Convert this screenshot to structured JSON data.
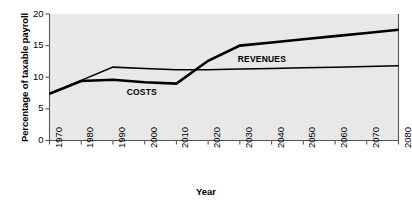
{
  "chart_data": {
    "type": "line",
    "title": "",
    "xlabel": "Year",
    "ylabel": "Percentage of taxable payroll",
    "xlim": [
      1970,
      2080
    ],
    "ylim": [
      0,
      20
    ],
    "grid": false,
    "legend_position": "inline-annotation",
    "x_ticks": [
      "1970",
      "1980",
      "1990",
      "2000",
      "2010",
      "2020",
      "2030",
      "2040",
      "2050",
      "2060",
      "2070",
      "2080"
    ],
    "y_ticks": [
      "0",
      "5",
      "10",
      "15",
      "20"
    ],
    "x": [
      1970,
      1980,
      1990,
      2000,
      2010,
      2020,
      2030,
      2040,
      2050,
      2060,
      2070,
      2080
    ],
    "series": [
      {
        "name": "COSTS",
        "style": "thick",
        "values": [
          7.4,
          9.4,
          9.6,
          9.2,
          9.0,
          12.6,
          15.0,
          15.5,
          16.0,
          16.5,
          17.0,
          17.5
        ]
      },
      {
        "name": "REVENUES",
        "style": "thin",
        "values": [
          7.4,
          9.5,
          11.6,
          11.4,
          11.2,
          11.2,
          11.3,
          11.4,
          11.5,
          11.6,
          11.7,
          11.8
        ]
      }
    ],
    "annotations": [
      {
        "text": "COSTS",
        "x": 2000,
        "y": 7.6
      },
      {
        "text": "REVENUES",
        "x": 2035,
        "y": 12.9
      }
    ],
    "colors": {
      "plot_background": "#e8e8e8",
      "line": "#000000",
      "axis": "#555555",
      "text": "#000000",
      "page_background": "#ffffff"
    }
  }
}
